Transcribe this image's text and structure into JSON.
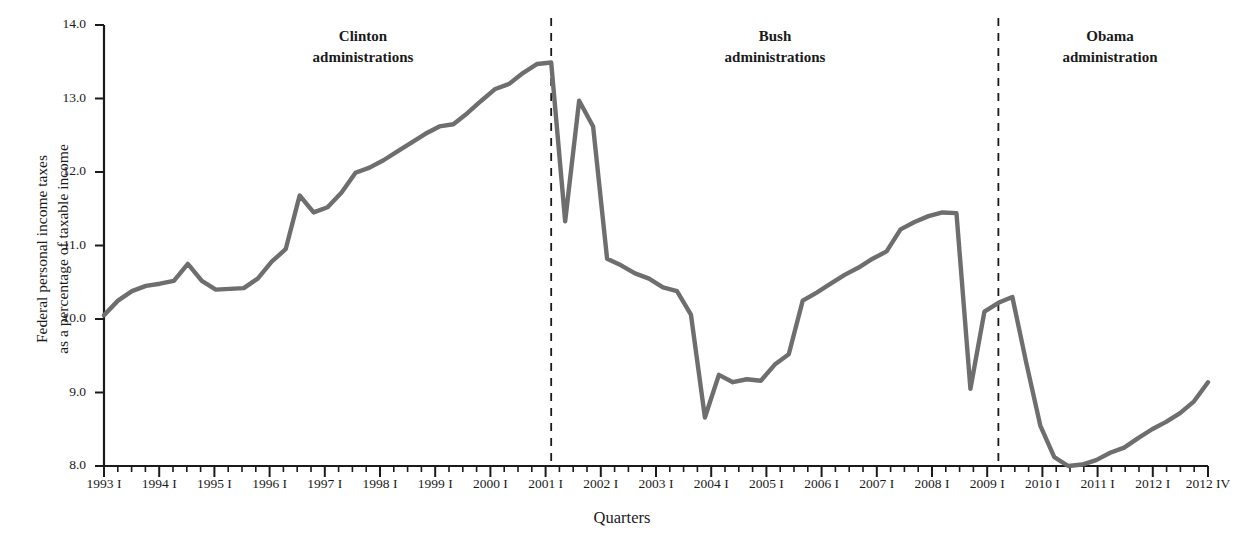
{
  "chart_data": {
    "type": "line",
    "title": "",
    "xlabel": "Quarters",
    "ylabel": "Federal personal income taxes\nas a percentage of taxable income",
    "ylim": [
      8.0,
      14.0
    ],
    "yticks": [
      "8.0",
      "9.0",
      "10.0",
      "11.0",
      "12.0",
      "13.0",
      "14.0"
    ],
    "ytick_values": [
      8.0,
      9.0,
      10.0,
      11.0,
      12.0,
      13.0,
      14.0
    ],
    "grid": false,
    "legend": "none",
    "line_color": "#6e6e6e",
    "axis_color": "#1a1a1a",
    "xtick_labels": [
      "1993 I",
      "1994 I",
      "1995 I",
      "1996 I",
      "1997 I",
      "1998 I",
      "1999 I",
      "2000 I",
      "2001 I",
      "2002 I",
      "2003 I",
      "2004 I",
      "2005 I",
      "2006 I",
      "2007 I",
      "2008 I",
      "2009 I",
      "2010 I",
      "2011 I",
      "2012 I",
      "2012 IV"
    ],
    "minor_ticks_per_major": 4,
    "x": [
      "1993 I",
      "1993 II",
      "1993 III",
      "1993 IV",
      "1994 I",
      "1994 II",
      "1994 III",
      "1994 IV",
      "1995 I",
      "1995 II",
      "1995 III",
      "1995 IV",
      "1996 I",
      "1996 II",
      "1996 III",
      "1996 IV",
      "1997 I",
      "1997 II",
      "1997 III",
      "1997 IV",
      "1998 I",
      "1998 II",
      "1998 III",
      "1998 IV",
      "1999 I",
      "1999 II",
      "1999 III",
      "1999 IV",
      "2000 I",
      "2000 II",
      "2000 III",
      "2000 IV",
      "2001 I",
      "2001 II",
      "2001 III",
      "2001 IV",
      "2002 I",
      "2002 II",
      "2002 III",
      "2002 IV",
      "2003 I",
      "2003 II",
      "2003 III",
      "2003 IV",
      "2004 I",
      "2004 II",
      "2004 III",
      "2004 IV",
      "2005 I",
      "2005 II",
      "2005 III",
      "2005 IV",
      "2006 I",
      "2006 II",
      "2006 III",
      "2006 IV",
      "2007 I",
      "2007 II",
      "2007 III",
      "2007 IV",
      "2008 I",
      "2008 II",
      "2008 III",
      "2008 IV",
      "2009 I",
      "2009 II",
      "2009 III",
      "2009 IV",
      "2010 I",
      "2010 II",
      "2010 III",
      "2010 IV",
      "2011 I",
      "2011 II",
      "2011 III",
      "2011 IV",
      "2012 I",
      "2012 II",
      "2012 III",
      "2012 IV"
    ],
    "values": [
      10.05,
      10.25,
      10.38,
      10.45,
      10.48,
      10.52,
      10.75,
      10.52,
      10.4,
      10.41,
      10.42,
      10.55,
      10.78,
      10.95,
      11.68,
      11.45,
      11.52,
      11.72,
      11.99,
      12.06,
      12.16,
      12.28,
      12.4,
      12.52,
      12.62,
      12.65,
      12.8,
      12.97,
      13.13,
      13.2,
      13.35,
      13.47,
      13.49,
      11.33,
      12.97,
      12.62,
      10.82,
      10.73,
      10.62,
      10.55,
      10.43,
      10.38,
      10.06,
      8.66,
      9.24,
      9.14,
      9.18,
      9.16,
      9.38,
      9.52,
      10.25,
      10.36,
      10.48,
      10.6,
      10.7,
      10.82,
      10.92,
      11.22,
      11.32,
      11.4,
      11.45,
      11.44,
      9.05,
      10.1,
      10.22,
      10.3,
      9.4,
      8.55,
      8.12,
      8.0,
      8.02,
      8.08,
      8.18,
      8.25,
      8.38,
      8.5,
      8.6,
      8.72,
      8.88,
      9.14
    ],
    "annotations": [
      {
        "label": "Clinton\nadministrations",
        "at": "1993 I - 2001 I"
      },
      {
        "label": "Bush\nadministrations",
        "at": "2001 I - 2009 I"
      },
      {
        "label": "Obama\nadministration",
        "at": "2009 I - 2012 IV"
      }
    ],
    "vertical_dividers": [
      {
        "label": "2001 I",
        "index": 32
      },
      {
        "label": "2009 I",
        "index": 64
      }
    ]
  },
  "axis": {
    "y_title": "Federal personal income taxes\nas a percentage of taxable income",
    "x_title": "Quarters"
  },
  "eras": {
    "clinton": "Clinton\nadministrations",
    "bush": "Bush\nadministrations",
    "obama": "Obama\nadministration"
  }
}
